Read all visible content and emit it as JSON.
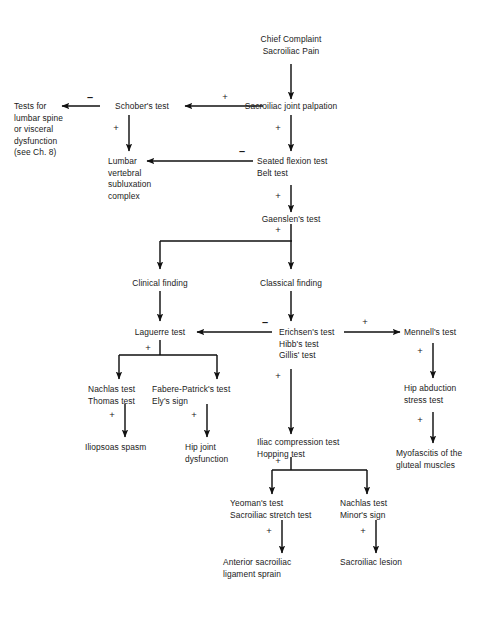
{
  "diagram": {
    "type": "clinical-decision-flowchart",
    "line_color": "#111111",
    "background_color": "#ffffff"
  },
  "nodes": {
    "chief_complaint": "Chief Complaint\nSacroiliac Pain",
    "si_joint_palpation": "Sacroiliac joint palpation",
    "schobers_test": "Schober's test",
    "tests_lumbar": "Tests for\nlumbar spine\nor visceral\ndysfunction\n(see Ch. 8)",
    "lumbar_vsc": "Lumbar\nvertebral\nsubluxation\ncomplex",
    "seated_flexion": "Seated flexion test\nBelt test",
    "gaenslens_test": "Gaenslen's test",
    "clinical_finding": "Clinical finding",
    "classical_finding": "Classical finding",
    "laguerre_test": "Laguerre test",
    "erichsens_group": "Erichsen's test\nHibb's test\nGillis' test",
    "mennells_test": "Mennell's test",
    "nachlas_thomas": "Nachlas test\nThomas test",
    "fabere_ely": "Fabere-Patrick's test\nEly's sign",
    "iliopsoas_spasm": "Iliopsoas spasm",
    "hip_joint_dysfunction": "Hip joint\ndysfunction",
    "iliac_hopping": "Iliac compression test\nHopping test",
    "hip_abduction": "Hip abduction\nstress test",
    "myofascitis": "Myofascitis of the\ngluteal muscles",
    "yeomans_group": "Yeoman's test\nSacroiliac stretch test",
    "nachlas_minors": "Nachlas test\nMinor's sign",
    "anterior_si_sprain": "Anterior sacroiliac\nligament sprain",
    "sacroiliac_lesion": "Sacroiliac lesion"
  },
  "edge_labels": {
    "palpation_to_schober": "+",
    "schober_to_tests": "–",
    "schober_to_lumbar": "+",
    "palpation_to_seated": "+",
    "seated_to_lumbar": "–",
    "seated_to_gaenslen": "+",
    "gaenslen_split": "+",
    "erichsen_to_laguerre": "–",
    "erichsen_to_mennell": "+",
    "laguerre_split": "+",
    "nachlas_to_iliopsoas": "+",
    "fabere_to_hip": "+",
    "erichsen_to_iliac": "+",
    "mennell_to_hipabd": "+",
    "hipabd_to_myofascitis": "+",
    "iliac_split": "+",
    "yeoman_to_sprain": "+",
    "nachlas_to_lesion": "+"
  }
}
